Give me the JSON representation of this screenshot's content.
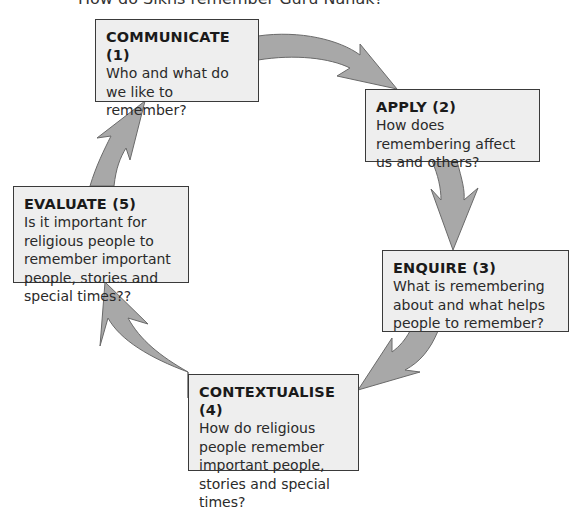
{
  "header": {
    "title": "How do Sikhs remember Guru Nanak?"
  },
  "diagram": {
    "type": "cycle",
    "colors": {
      "arrow_fill": "#a8a8a8",
      "arrow_stroke": "#6a6a6a",
      "box_fill": "#eeeeee",
      "box_border": "#3a3a3a"
    },
    "steps": [
      {
        "title": "COMMUNICATE (1)",
        "question": "Who and what do we like to remember?"
      },
      {
        "title": "APPLY (2)",
        "question": "How does remembering affect us and others?"
      },
      {
        "title": "ENQUIRE (3)",
        "question": "What is remembering about and what helps people to remember?"
      },
      {
        "title": "CONTEXTUALISE (4)",
        "question": "How do religious people remember important people, stories and special times?"
      },
      {
        "title": "EVALUATE (5)",
        "question": "Is it important for religious people to remember important people, stories and special times??"
      }
    ]
  }
}
